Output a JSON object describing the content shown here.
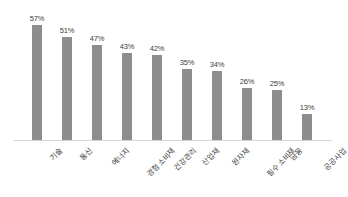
{
  "chart_data": {
    "type": "bar",
    "title": "",
    "subtitle": "",
    "xlabel": "",
    "ylabel": "",
    "ylim": [
      0,
      60
    ],
    "grid": false,
    "legend": false,
    "legend_position": "none",
    "orientation": "vertical",
    "bar_color": "#8d8d8d",
    "background_color": "#ffffff",
    "axis_line_color": "#d4d4d4",
    "label_rotation_deg": -45,
    "value_suffix": "%",
    "categories": [
      "기술",
      "통신",
      "에너지",
      "경험 소비재",
      "건강관리",
      "산업재",
      "원자재",
      "필수 소비재",
      "금융",
      "공공사업"
    ],
    "values": [
      57,
      51,
      47,
      43,
      42,
      35,
      34,
      26,
      25,
      13
    ],
    "value_labels": [
      "57%",
      "51%",
      "47%",
      "43%",
      "42%",
      "35%",
      "34%",
      "26%",
      "25%",
      "13%"
    ]
  }
}
